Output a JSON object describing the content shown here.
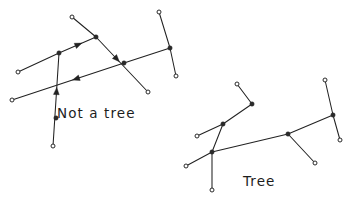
{
  "figure": {
    "background_color": "#ffffff",
    "ink_color": "#222222",
    "width": 355,
    "height": 217,
    "caption_left": "Not a tree",
    "caption_right": "Tree"
  },
  "labels": [
    {
      "name": "not-a-tree",
      "text": "Not a tree",
      "x": 57,
      "y": 118
    },
    {
      "name": "tree",
      "text": "Tree",
      "x": 243,
      "y": 186
    }
  ],
  "graphs": [
    {
      "name": "not-a-tree-graph",
      "title": "Not a tree",
      "directed": true,
      "has_cycle": true,
      "nodes": [
        {
          "id": "L1",
          "x": 18,
          "y": 72,
          "style": "hollow"
        },
        {
          "id": "L2",
          "x": 12,
          "y": 100,
          "style": "hollow"
        },
        {
          "id": "L3",
          "x": 59,
          "y": 53,
          "style": "solid"
        },
        {
          "id": "L4",
          "x": 56,
          "y": 118,
          "style": "solid"
        },
        {
          "id": "L5",
          "x": 53,
          "y": 146,
          "style": "hollow"
        },
        {
          "id": "L6",
          "x": 72,
          "y": 17,
          "style": "hollow"
        },
        {
          "id": "L7",
          "x": 96,
          "y": 37,
          "style": "solid"
        },
        {
          "id": "L8",
          "x": 124,
          "y": 63,
          "style": "solid"
        },
        {
          "id": "L9",
          "x": 148,
          "y": 92,
          "style": "hollow"
        },
        {
          "id": "L10",
          "x": 159,
          "y": 12,
          "style": "hollow"
        },
        {
          "id": "L11",
          "x": 170,
          "y": 48,
          "style": "solid"
        },
        {
          "id": "L12",
          "x": 176,
          "y": 76,
          "style": "hollow"
        }
      ],
      "edges": [
        {
          "from": "L1",
          "to": "L3",
          "arrow": false
        },
        {
          "from": "L3",
          "to": "L7",
          "arrow": true,
          "arrow_at": 0.62
        },
        {
          "from": "L6",
          "to": "L7",
          "arrow": false
        },
        {
          "from": "L7",
          "to": "L9",
          "arrow": true,
          "arrow_at": 0.45
        },
        {
          "from": "L8",
          "to": "L2",
          "arrow": true,
          "arrow_at": 0.46
        },
        {
          "from": "L5",
          "to": "L3",
          "arrow": true,
          "arrow_at": 0.63
        },
        {
          "from": "L8",
          "to": "L11",
          "arrow": false
        },
        {
          "from": "L10",
          "to": "L11",
          "arrow": false
        },
        {
          "from": "L11",
          "to": "L12",
          "arrow": false
        }
      ]
    },
    {
      "name": "tree-graph",
      "title": "Tree",
      "directed": false,
      "has_cycle": false,
      "nodes": [
        {
          "id": "T1",
          "x": 197,
          "y": 136,
          "style": "hollow"
        },
        {
          "id": "T2",
          "x": 223,
          "y": 124,
          "style": "solid"
        },
        {
          "id": "T3",
          "x": 212,
          "y": 190,
          "style": "hollow"
        },
        {
          "id": "T4",
          "x": 212,
          "y": 152,
          "style": "solid"
        },
        {
          "id": "T5",
          "x": 186,
          "y": 166,
          "style": "hollow"
        },
        {
          "id": "T6",
          "x": 252,
          "y": 104,
          "style": "solid"
        },
        {
          "id": "T7",
          "x": 237,
          "y": 84,
          "style": "hollow"
        },
        {
          "id": "T8",
          "x": 288,
          "y": 134,
          "style": "solid"
        },
        {
          "id": "T9",
          "x": 315,
          "y": 163,
          "style": "hollow"
        },
        {
          "id": "T10",
          "x": 333,
          "y": 115,
          "style": "solid"
        },
        {
          "id": "T11",
          "x": 325,
          "y": 80,
          "style": "hollow"
        },
        {
          "id": "T12",
          "x": 340,
          "y": 140,
          "style": "hollow"
        }
      ],
      "edges": [
        {
          "from": "T1",
          "to": "T2",
          "arrow": false
        },
        {
          "from": "T2",
          "to": "T4",
          "arrow": false
        },
        {
          "from": "T4",
          "to": "T3",
          "arrow": false
        },
        {
          "from": "T4",
          "to": "T5",
          "arrow": false
        },
        {
          "from": "T2",
          "to": "T6",
          "arrow": false
        },
        {
          "from": "T6",
          "to": "T7",
          "arrow": false
        },
        {
          "from": "T4",
          "to": "T8",
          "arrow": false
        },
        {
          "from": "T8",
          "to": "T9",
          "arrow": false
        },
        {
          "from": "T8",
          "to": "T10",
          "arrow": false
        },
        {
          "from": "T10",
          "to": "T11",
          "arrow": false
        },
        {
          "from": "T10",
          "to": "T12",
          "arrow": false
        }
      ]
    }
  ]
}
